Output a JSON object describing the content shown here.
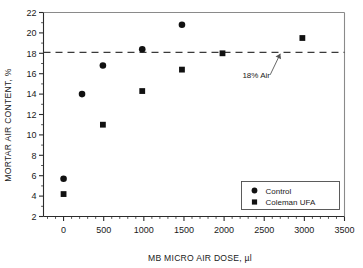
{
  "chart_data": {
    "type": "scatter",
    "title": "",
    "xlabel": "MB MICRO AIR DOSE, µl",
    "ylabel": "MORTAR AIR CONTENT, %",
    "xlim": [
      -250,
      3500
    ],
    "ylim": [
      2,
      22
    ],
    "xticks": [
      0,
      500,
      1000,
      1500,
      2000,
      2500,
      3000,
      3500
    ],
    "yticks": [
      2,
      4,
      6,
      8,
      10,
      12,
      14,
      16,
      18,
      20,
      22
    ],
    "xtick_labels": [
      "0",
      "500",
      "1000",
      "1500",
      "2000",
      "2500",
      "3000",
      "3500"
    ],
    "ytick_labels": [
      "2",
      "4",
      "6",
      "8",
      "10",
      "12",
      "14",
      "16",
      "18",
      "20",
      "22"
    ],
    "x_minor_step": 100,
    "y_minor_step": 1,
    "grid": false,
    "legend_position": "lower right",
    "series": [
      {
        "name": "Control",
        "marker": "circle",
        "color": "#111111",
        "points": [
          {
            "x": 0,
            "y": 5.7
          },
          {
            "x": 230,
            "y": 14.0
          },
          {
            "x": 490,
            "y": 16.8
          },
          {
            "x": 980,
            "y": 18.4
          },
          {
            "x": 1475,
            "y": 20.8
          }
        ]
      },
      {
        "name": "Coleman UFA",
        "marker": "square",
        "color": "#111111",
        "points": [
          {
            "x": 0,
            "y": 4.2
          },
          {
            "x": 490,
            "y": 11.0
          },
          {
            "x": 980,
            "y": 14.3
          },
          {
            "x": 1475,
            "y": 16.4
          },
          {
            "x": 1980,
            "y": 18.0
          },
          {
            "x": 2975,
            "y": 19.5
          }
        ]
      }
    ],
    "reference_lines": [
      {
        "label": "18% Air",
        "orientation": "horizontal",
        "value": 18.1,
        "style": "dashed",
        "color": "#3a3a3a"
      }
    ],
    "annotations": [
      {
        "text": "18% Air",
        "x": 2400,
        "y": 15.6,
        "points_to_x": 2700,
        "points_to_y": 18.1
      }
    ]
  },
  "legend": {
    "entries": [
      {
        "label": "Control",
        "marker": "circle"
      },
      {
        "label": "Coleman UFA",
        "marker": "square"
      }
    ]
  }
}
